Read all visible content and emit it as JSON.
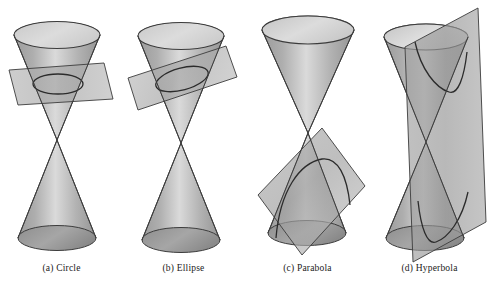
{
  "figure": {
    "background_color": "#ffffff",
    "colors": {
      "cone_body_light": "#d9d9d9",
      "cone_body_mid": "#a9a9a9",
      "cone_body_dark": "#8f8f8f",
      "cap_fill": "#d4d4d4",
      "base_fill": "#9a9a9a",
      "plane_fill": "#9d9d9d",
      "outline": "#3c3c3c",
      "curve_stroke": "#2b2b2b",
      "caption_text": "#1a1a1a"
    },
    "panels": [
      {
        "id": "circle",
        "caption": "(a) Circle",
        "conic_name": "Circle",
        "plane_orientation": "horizontal, perpendicular to cone axis",
        "nappes_cut": "upper only",
        "cross_section_shape": "ellipse drawn in perspective representing a circle"
      },
      {
        "id": "ellipse",
        "caption": "(b) Ellipse",
        "conic_name": "Ellipse",
        "plane_orientation": "tilted, oblique to cone axis but less steep than the slant line",
        "nappes_cut": "upper only",
        "cross_section_shape": "ellipse"
      },
      {
        "id": "parabola",
        "caption": "(c) Parabola",
        "conic_name": "Parabola",
        "plane_orientation": "tilted parallel to a slant line of the cone",
        "nappes_cut": "lower only",
        "cross_section_shape": "open curve, parabola"
      },
      {
        "id": "hyperbola",
        "caption": "(d) Hyperbola",
        "conic_name": "Hyperbola",
        "plane_orientation": "near-vertical, parallel to the cone axis",
        "nappes_cut": "both upper and lower",
        "cross_section_shape": "two opposing open branches"
      }
    ]
  }
}
